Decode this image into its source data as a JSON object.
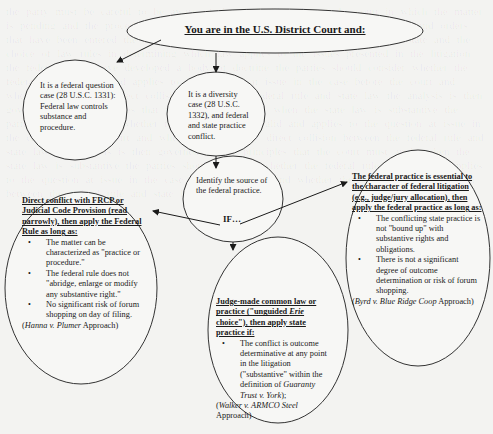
{
  "diagram": {
    "title": "You are in the U.S. District Court and:",
    "federal_question": {
      "text": "It is a federal question case  (28 U.S.C. 1331): Federal law controls substance and procedure."
    },
    "diversity": {
      "text": "It is a diversity case (28 U.S.C. 1332), and federal and state practice conflict."
    },
    "identify": {
      "text": "Identify the source of the federal practice.",
      "if_label": "IF…"
    },
    "hanna": {
      "heading": "Direct conflict with FRCP or Judicial Code Provision (read narrowly), then  apply the Federal Rule as long as:",
      "bullets": [
        "The matter can be characterized as \"practice or procedure.\"",
        "The federal rule does not \"abridge, enlarge or modify any substantive right.\"",
        "No significant risk of forum shopping on day of filing."
      ],
      "citation_case": "Hanna v. Plumer",
      "citation_suffix": " Approach)"
    },
    "walker": {
      "heading_a": "Judge-made common law or practice (\"unguided ",
      "heading_erie": "Erie",
      "heading_b": " choice\"), then apply state practice if:",
      "bullet_text": "The conflict is outcome determinative at any point in the litigation (\"substantive\" within the definition of ",
      "bullet_case": "Guaranty Trust v. York",
      "bullet_end": ");",
      "citation_case": "Walker v. ARMCO Steel",
      "citation_suffix": "Approach)"
    },
    "byrd": {
      "heading": "The federal practice is essential to the character of federal litigation (e.g.,  judge/jury allocation), then apply the federal practice as long as:",
      "bullets": [
        "The conflicting state practice is not \"bound up\" with substantive rights and obligations.",
        "There is not a significant degree of outcome determination or risk of forum shopping."
      ],
      "citation_case": "Byrd v. Blue Ridge Coop",
      "citation_suffix": "Approach)"
    }
  }
}
